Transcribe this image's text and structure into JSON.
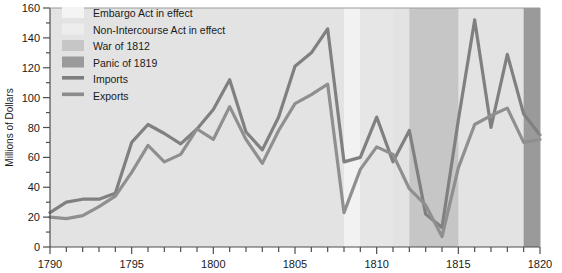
{
  "chart_data": {
    "type": "line",
    "title": "",
    "xlabel": "",
    "ylabel": "Millions of Dollars",
    "xlim": [
      1790,
      1820
    ],
    "ylim": [
      0,
      160
    ],
    "ytick_step": 20,
    "yticks": [
      0,
      20,
      40,
      60,
      80,
      100,
      120,
      140,
      160
    ],
    "xtick_labels": [
      "1790",
      "1795",
      "1800",
      "1805",
      "1810",
      "1815",
      "1820"
    ],
    "xtick_step": 5,
    "minor_xtick_step": 1,
    "grid": false,
    "legend_position": "upper-left-inside",
    "x": [
      1790,
      1791,
      1792,
      1793,
      1794,
      1795,
      1796,
      1797,
      1798,
      1799,
      1800,
      1801,
      1802,
      1803,
      1804,
      1805,
      1806,
      1807,
      1808,
      1809,
      1810,
      1811,
      1812,
      1813,
      1814,
      1815,
      1816,
      1817,
      1818,
      1819,
      1820
    ],
    "series": [
      {
        "name": "Imports",
        "color": "#808080",
        "values": [
          23,
          30,
          32,
          32,
          36,
          70,
          82,
          76,
          69,
          79,
          92,
          112,
          77,
          65,
          87,
          121,
          130,
          146,
          57,
          60,
          87,
          57,
          78,
          22,
          13,
          85,
          152,
          80,
          129,
          89,
          75
        ]
      },
      {
        "name": "Exports",
        "color": "#8f8f8f",
        "values": [
          20,
          19,
          21,
          27,
          34,
          50,
          68,
          57,
          62,
          79,
          72,
          94,
          72,
          56,
          78,
          96,
          102,
          109,
          23,
          52,
          67,
          62,
          39,
          28,
          7,
          53,
          82,
          88,
          93,
          70,
          72
        ]
      }
    ],
    "bands": [
      {
        "name": "Embargo Act in effect",
        "label": "Embargo Act in effect",
        "start": 1808,
        "end": 1809,
        "color": "#f2f2f2"
      },
      {
        "name": "Non-Intercourse Act in effect",
        "label": "Non-Intercourse Act in effect",
        "start": 1809,
        "end": 1811,
        "color": "#e6e6e6"
      },
      {
        "name": "War of 1812",
        "label": "War of 1812",
        "start": 1812,
        "end": 1815,
        "color": "#c6c6c6"
      },
      {
        "name": "Panic of 1819",
        "label": "Panic of 1819",
        "start": 1819,
        "end": 1820,
        "color": "#9a9a9a"
      }
    ],
    "plot_background": "#e3e3e3"
  },
  "legend": {
    "items": [
      {
        "label": "Embargo Act in effect",
        "type": "swatch",
        "color": "#f4f4f4"
      },
      {
        "label": "Non-Intercourse Act in effect",
        "type": "swatch",
        "color": "#ededed"
      },
      {
        "label": "War of 1812",
        "type": "swatch",
        "color": "#c6c6c6"
      },
      {
        "label": "Panic of 1819",
        "type": "swatch",
        "color": "#9a9a9a"
      },
      {
        "label": "Imports",
        "type": "line",
        "color": "#7d7d7d"
      },
      {
        "label": "Exports",
        "type": "line",
        "color": "#8c8c8c"
      }
    ]
  },
  "axes": {
    "y_title": "Millions of Dollars",
    "y_labels": [
      "160",
      "140",
      "120",
      "100",
      "80",
      "60",
      "40",
      "20",
      "0"
    ],
    "x_labels": [
      "1790",
      "1795",
      "1800",
      "1805",
      "1810",
      "1815",
      "1820"
    ]
  }
}
